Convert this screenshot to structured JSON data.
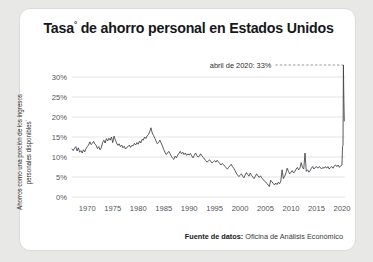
{
  "card": {
    "title": "Tasa",
    "title_sup": "°",
    "title_rest": " de ahorro personal en Estados Unidos",
    "title_full": "Tasa° de ahorro personal en Estados Unidos",
    "background": "#ffffff",
    "page_background": "#e8e8e6",
    "border_color": "#dcdcd8"
  },
  "footer": {
    "source_label": "Fuente de datos:",
    "source_value": "Oficina de Análisis Económico"
  },
  "chart_data": {
    "type": "line",
    "title": "Tasa° de ahorro personal en Estados Unidos",
    "subtitle": "",
    "xlabel": "",
    "ylabel": "Ahorros como una porción de los ingresos personales disponibles°",
    "ylabel_text": "Ahorros como una porción de los ingresos personales disponibles",
    "ylabel_sup": "°",
    "xlim": [
      1967.0,
      2020.6
    ],
    "ylim": [
      0,
      33.5
    ],
    "ytick_values": [
      0,
      5,
      10,
      15,
      20,
      25,
      30
    ],
    "ytick_labels": [
      "0%",
      "5%",
      "10%",
      "15%",
      "20%",
      "25%",
      "30%"
    ],
    "xtick_values": [
      1970,
      1975,
      1980,
      1985,
      1990,
      1995,
      2000,
      2005,
      2010,
      2015,
      2020
    ],
    "xtick_labels": [
      "1970",
      "1975",
      "1980",
      "1985",
      "1990",
      "1995",
      "2000",
      "2005",
      "2010",
      "2015",
      "2020"
    ],
    "grid": "horizontal",
    "grid_color": "#d9d9d9",
    "legend": "none",
    "line_color": "#3c3f44",
    "line_width": 0.85,
    "annotations": [
      {
        "name": "peak-2020",
        "text": "abril de 2020: 33%",
        "x": 2020.29,
        "y": 33.0,
        "connector": "dashed"
      }
    ],
    "series": [
      {
        "name": "Tasa de ahorro personal",
        "units": "porcentaje",
        "x": [
          1967.0,
          1967.25,
          1967.5,
          1967.75,
          1968.0,
          1968.25,
          1968.5,
          1968.75,
          1969.0,
          1969.25,
          1969.5,
          1969.75,
          1970.0,
          1970.25,
          1970.5,
          1970.75,
          1971.0,
          1971.25,
          1971.5,
          1971.75,
          1972.0,
          1972.25,
          1972.5,
          1972.75,
          1973.0,
          1973.25,
          1973.5,
          1973.75,
          1974.0,
          1974.25,
          1974.5,
          1974.75,
          1975.0,
          1975.25,
          1975.5,
          1975.75,
          1976.0,
          1976.25,
          1976.5,
          1976.75,
          1977.0,
          1977.25,
          1977.5,
          1977.75,
          1978.0,
          1978.25,
          1978.5,
          1978.75,
          1979.0,
          1979.25,
          1979.5,
          1979.75,
          1980.0,
          1980.25,
          1980.5,
          1980.75,
          1981.0,
          1981.25,
          1981.5,
          1981.75,
          1982.0,
          1982.25,
          1982.5,
          1982.75,
          1983.0,
          1983.25,
          1983.5,
          1983.75,
          1984.0,
          1984.25,
          1984.5,
          1984.75,
          1985.0,
          1985.25,
          1985.5,
          1985.75,
          1986.0,
          1986.25,
          1986.5,
          1986.75,
          1987.0,
          1987.25,
          1987.5,
          1987.75,
          1988.0,
          1988.25,
          1988.5,
          1988.75,
          1989.0,
          1989.25,
          1989.5,
          1989.75,
          1990.0,
          1990.25,
          1990.5,
          1990.75,
          1991.0,
          1991.25,
          1991.5,
          1991.75,
          1992.0,
          1992.25,
          1992.5,
          1992.75,
          1993.0,
          1993.25,
          1993.5,
          1993.75,
          1994.0,
          1994.25,
          1994.5,
          1994.75,
          1995.0,
          1995.25,
          1995.5,
          1995.75,
          1996.0,
          1996.25,
          1996.5,
          1996.75,
          1997.0,
          1997.25,
          1997.5,
          1997.75,
          1998.0,
          1998.25,
          1998.5,
          1998.75,
          1999.0,
          1999.25,
          1999.5,
          1999.75,
          2000.0,
          2000.25,
          2000.5,
          2000.75,
          2001.0,
          2001.25,
          2001.5,
          2001.75,
          2002.0,
          2002.25,
          2002.5,
          2002.75,
          2003.0,
          2003.25,
          2003.5,
          2003.75,
          2004.0,
          2004.25,
          2004.5,
          2004.75,
          2005.0,
          2005.25,
          2005.5,
          2005.75,
          2006.0,
          2006.25,
          2006.5,
          2006.75,
          2007.0,
          2007.25,
          2007.5,
          2007.75,
          2008.0,
          2008.25,
          2008.5,
          2008.75,
          2009.0,
          2009.25,
          2009.5,
          2009.75,
          2010.0,
          2010.25,
          2010.5,
          2010.75,
          2011.0,
          2011.25,
          2011.5,
          2011.75,
          2012.0,
          2012.25,
          2012.5,
          2012.75,
          2013.0,
          2013.25,
          2013.5,
          2013.75,
          2014.0,
          2014.25,
          2014.5,
          2014.75,
          2015.0,
          2015.25,
          2015.5,
          2015.75,
          2016.0,
          2016.25,
          2016.5,
          2016.75,
          2017.0,
          2017.25,
          2017.5,
          2017.75,
          2018.0,
          2018.25,
          2018.5,
          2018.75,
          2019.0,
          2019.25,
          2019.5,
          2019.75,
          2020.0,
          2020.12,
          2020.21,
          2020.29,
          2020.38,
          2020.46
        ],
        "y": [
          12.0,
          11.6,
          12.2,
          12.6,
          11.5,
          12.3,
          11.2,
          11.6,
          11.0,
          11.8,
          11.3,
          12.1,
          12.6,
          13.0,
          13.8,
          13.1,
          13.4,
          13.9,
          13.2,
          12.9,
          12.1,
          12.6,
          11.8,
          12.3,
          13.6,
          14.2,
          13.5,
          14.6,
          14.0,
          14.7,
          14.2,
          15.0,
          13.6,
          15.2,
          14.3,
          13.5,
          12.9,
          13.3,
          12.6,
          13.0,
          12.3,
          12.7,
          12.0,
          12.4,
          12.6,
          13.0,
          12.4,
          12.9,
          12.8,
          13.4,
          13.0,
          13.6,
          13.2,
          14.0,
          13.5,
          14.4,
          14.2,
          15.0,
          14.6,
          15.3,
          15.6,
          16.3,
          17.3,
          16.0,
          15.4,
          14.7,
          14.0,
          13.3,
          13.6,
          14.2,
          13.5,
          12.8,
          11.9,
          11.2,
          10.6,
          11.0,
          11.4,
          10.8,
          10.2,
          9.7,
          9.4,
          10.2,
          9.8,
          10.5,
          10.9,
          11.4,
          10.8,
          11.2,
          10.6,
          11.0,
          10.4,
          10.8,
          10.5,
          10.9,
          10.3,
          9.8,
          10.4,
          11.0,
          10.4,
          10.0,
          10.2,
          10.8,
          10.3,
          9.9,
          9.5,
          9.1,
          8.7,
          9.0,
          9.3,
          8.9,
          8.5,
          8.8,
          9.1,
          8.7,
          9.2,
          8.8,
          8.4,
          8.0,
          8.4,
          8.1,
          7.7,
          7.3,
          7.0,
          7.4,
          7.8,
          8.2,
          7.6,
          7.2,
          6.6,
          6.0,
          5.5,
          5.1,
          5.4,
          5.8,
          5.2,
          4.8,
          5.5,
          6.1,
          5.6,
          5.2,
          6.0,
          5.4,
          5.0,
          4.6,
          5.2,
          5.8,
          5.3,
          4.9,
          5.3,
          4.8,
          4.4,
          4.0,
          3.8,
          3.4,
          3.0,
          2.6,
          4.2,
          3.8,
          3.4,
          3.0,
          3.5,
          3.1,
          3.7,
          3.3,
          4.0,
          6.8,
          4.6,
          5.2,
          6.0,
          7.2,
          6.4,
          5.8,
          6.2,
          6.6,
          6.0,
          6.4,
          7.0,
          7.4,
          6.8,
          7.2,
          8.6,
          7.4,
          7.0,
          11.0,
          6.4,
          6.8,
          6.2,
          6.6,
          7.2,
          7.6,
          7.0,
          7.4,
          7.6,
          7.2,
          7.6,
          7.4,
          7.0,
          7.4,
          7.2,
          7.6,
          7.2,
          7.6,
          7.0,
          7.4,
          7.6,
          7.2,
          7.8,
          8.0,
          7.6,
          8.0,
          7.4,
          7.8,
          8.0,
          12.7,
          12.9,
          33.0,
          24.2,
          19.0
        ]
      }
    ]
  }
}
